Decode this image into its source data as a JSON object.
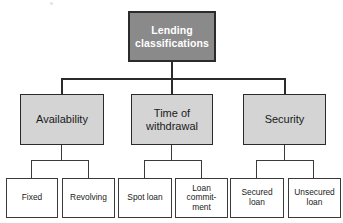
{
  "diagram": {
    "title": "Lending classifications",
    "type": "hierarchy-tree",
    "colors": {
      "root_fill": "#8a8a8a",
      "root_text": "#ffffff",
      "category_fill": "#d4d4d4",
      "leaf_fill": "#ffffff",
      "border": "#2b2b2b",
      "text": "#1a1a1a",
      "background": "#ffffff"
    },
    "root": {
      "label": "Lending\nclassifications",
      "x": 128,
      "y": 11,
      "w": 88,
      "h": 51
    },
    "categories": [
      {
        "label": "Availability",
        "x": 20,
        "y": 94,
        "w": 84,
        "h": 51,
        "children": [
          {
            "label": "Fixed",
            "x": 6,
            "y": 178,
            "w": 52,
            "h": 40
          },
          {
            "label": "Revolving",
            "x": 62,
            "y": 178,
            "w": 53,
            "h": 40
          }
        ]
      },
      {
        "label": "Time of\nwithdrawal",
        "x": 131,
        "y": 94,
        "w": 82,
        "h": 51,
        "children": [
          {
            "label": "Spot loan",
            "x": 118,
            "y": 178,
            "w": 54,
            "h": 40
          },
          {
            "label": "Loan\ncommit-\nment",
            "x": 175,
            "y": 178,
            "w": 53,
            "h": 40
          }
        ]
      },
      {
        "label": "Security",
        "x": 243,
        "y": 94,
        "w": 83,
        "h": 51,
        "children": [
          {
            "label": "Secured\nloan",
            "x": 230,
            "y": 178,
            "w": 54,
            "h": 40
          },
          {
            "label": "Unsecured\nloan",
            "x": 288,
            "y": 178,
            "w": 53,
            "h": 40
          }
        ]
      }
    ]
  }
}
